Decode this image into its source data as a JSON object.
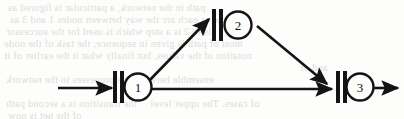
{
  "diagram": {
    "type": "petri-net-fragment",
    "canvas": {
      "width": 404,
      "height": 119
    },
    "ink_color": "#141414",
    "paper_color": "#fdfdfc",
    "nodes": [
      {
        "id": "node-1",
        "label": "1",
        "circle": {
          "cx": 138,
          "cy": 87,
          "r": 13.5
        },
        "bars": [
          {
            "x": 113,
            "y": 71,
            "w": 4,
            "h": 32
          },
          {
            "x": 120,
            "y": 71,
            "w": 4,
            "h": 32
          }
        ]
      },
      {
        "id": "node-2",
        "label": "2",
        "circle": {
          "cx": 238,
          "cy": 25,
          "r": 13.5
        },
        "bars": [
          {
            "x": 212,
            "y": 9,
            "w": 4,
            "h": 32
          },
          {
            "x": 219,
            "y": 9,
            "w": 4,
            "h": 32
          }
        ]
      },
      {
        "id": "node-3",
        "label": "3",
        "circle": {
          "cx": 360,
          "cy": 87,
          "r": 13.5
        },
        "bars": [
          {
            "x": 336,
            "y": 71,
            "w": 4,
            "h": 32
          },
          {
            "x": 343,
            "y": 71,
            "w": 4,
            "h": 32
          }
        ]
      }
    ],
    "arrows": [
      {
        "id": "arrow-input",
        "from": "external-source",
        "to": "node-1",
        "x1": 58,
        "y1": 88,
        "x2": 112,
        "y2": 88
      },
      {
        "id": "arrow-1-to-2",
        "from": "node-1",
        "to": "node-2",
        "x1": 146,
        "y1": 84,
        "x2": 209,
        "y2": 19
      },
      {
        "id": "arrow-1-to-3",
        "from": "node-1",
        "to": "node-3",
        "x1": 148,
        "y1": 89,
        "x2": 332,
        "y2": 89
      },
      {
        "id": "arrow-2-to-3",
        "from": "node-2",
        "to": "node-3",
        "x1": 257,
        "y1": 26,
        "x2": 327,
        "y2": 84
      },
      {
        "id": "arrow-output",
        "from": "node-3",
        "to": "external-sink",
        "x1": 370,
        "y1": 88,
        "x2": 398,
        "y2": 88
      }
    ]
  },
  "background_bleed": {
    "description": "faint mirrored show-through text from reverse side of page",
    "lines": [
      {
        "text": "path in the network, a particular is figured as",
        "x": 8,
        "y": 2
      },
      {
        "text": "same as each arc the way between nodes 1 and 3 as",
        "x": 10,
        "y": 14
      },
      {
        "text": "is to 2 is a step which is used for the successor",
        "x": 6,
        "y": 26
      },
      {
        "text": "most of path is given in sequence; the task of the node",
        "x": 4,
        "y": 38
      },
      {
        "text": "notation of the values, but finally what it the earlier of it",
        "x": 4,
        "y": 50
      },
      {
        "text": "and of",
        "x": 300,
        "y": 62
      },
      {
        "text": "ensemble between the processes in the network",
        "x": 6,
        "y": 74
      },
      {
        "text": "the transition is a second path",
        "x": 6,
        "y": 98
      },
      {
        "text": "of cases. The upper level",
        "x": 150,
        "y": 98
      },
      {
        "text": "of the net is now",
        "x": 8,
        "y": 110
      }
    ]
  }
}
